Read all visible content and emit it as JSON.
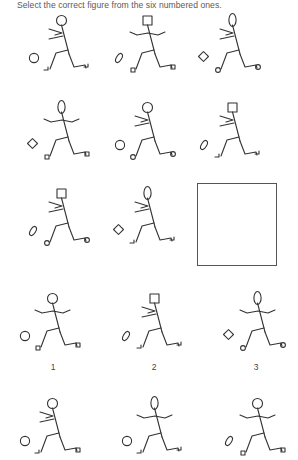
{
  "instruction": "Select the correct figure from the six numbered ones.",
  "matrix": {
    "rows": [
      [
        {
          "head": "circle",
          "arms": "back",
          "ball": "circle",
          "back_foot": "hook",
          "front_foot": "hook"
        },
        {
          "head": "square",
          "arms": "spread",
          "ball": "oval",
          "back_foot": "square",
          "front_foot": "square"
        },
        {
          "head": "oval",
          "arms": "back",
          "ball": "diamond",
          "back_foot": "circle",
          "front_foot": "circle"
        }
      ],
      [
        {
          "head": "oval",
          "arms": "spread",
          "ball": "diamond",
          "back_foot": "square",
          "front_foot": "square"
        },
        {
          "head": "circle",
          "arms": "back",
          "ball": "circle",
          "back_foot": "circle",
          "front_foot": "circle"
        },
        {
          "head": "square",
          "arms": "back",
          "ball": "oval",
          "back_foot": "hook",
          "front_foot": "hook"
        }
      ],
      [
        {
          "head": "square",
          "arms": "back",
          "ball": "oval",
          "back_foot": "circle",
          "front_foot": "circle"
        },
        {
          "head": "oval",
          "arms": "back",
          "ball": "diamond",
          "back_foot": "hook",
          "front_foot": "hook"
        },
        {
          "empty": true
        }
      ]
    ]
  },
  "options": [
    {
      "label": "1",
      "head": "circle",
      "arms": "spread",
      "ball": "circle",
      "back_foot": "square",
      "front_foot": "square"
    },
    {
      "label": "2",
      "head": "square",
      "arms": "back",
      "ball": "oval",
      "back_foot": "hook",
      "front_foot": "hook"
    },
    {
      "label": "3",
      "head": "oval",
      "arms": "spread",
      "ball": "diamond",
      "back_foot": "circle",
      "front_foot": "circle"
    },
    {
      "label": "4",
      "head": "circle",
      "arms": "back",
      "ball": "circle",
      "back_foot": "hook",
      "front_foot": "square"
    },
    {
      "label": "5",
      "head": "oval",
      "arms": "spread",
      "ball": "circle",
      "back_foot": "hook",
      "front_foot": "hook"
    },
    {
      "label": "6",
      "head": "circle",
      "arms": "spread",
      "ball": "oval",
      "back_foot": "square",
      "front_foot": "square"
    }
  ]
}
